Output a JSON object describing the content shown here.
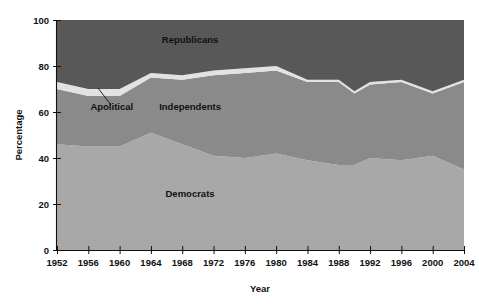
{
  "chart_data": {
    "type": "area",
    "stacked": true,
    "title": "",
    "xlabel": "Year",
    "ylabel": "Percentage",
    "xlim": [
      1952,
      2004
    ],
    "ylim": [
      0,
      100
    ],
    "grid": false,
    "legend_position": "inline-annotations",
    "x": [
      1952,
      1956,
      1960,
      1964,
      1968,
      1972,
      1976,
      1980,
      1984,
      1988,
      1990,
      1992,
      1996,
      2000,
      2004
    ],
    "xtick_labels": [
      "1952",
      "1956",
      "1960",
      "1964",
      "1968",
      "1972",
      "1976",
      "1980",
      "1984",
      "1988",
      "1992",
      "1996",
      "2000",
      "2004"
    ],
    "xticks": [
      1952,
      1956,
      1960,
      1964,
      1968,
      1972,
      1976,
      1980,
      1984,
      1988,
      1992,
      1996,
      2000,
      2004
    ],
    "ytick_labels": [
      "0",
      "20",
      "40",
      "60",
      "80",
      "100"
    ],
    "yticks": [
      0,
      20,
      40,
      60,
      80,
      100
    ],
    "series": [
      {
        "name": "Democrats",
        "color": "#a8a8a8",
        "values": [
          46,
          45,
          45,
          51,
          46,
          41,
          40,
          42,
          39,
          37,
          37,
          40,
          39,
          41,
          35
        ]
      },
      {
        "name": "Independents",
        "color": "#8a8a8a",
        "values": [
          24,
          22,
          22,
          24,
          28,
          35,
          37,
          36,
          34,
          36,
          31,
          32,
          34,
          27,
          38
        ]
      },
      {
        "name": "Apolitical",
        "color": "#e2e2e2",
        "values": [
          3,
          3,
          3,
          2,
          2,
          2,
          2,
          2,
          1,
          1,
          1,
          1,
          1,
          1,
          1
        ]
      },
      {
        "name": "Republicans",
        "color": "#585858",
        "values": [
          27,
          30,
          30,
          23,
          24,
          22,
          21,
          20,
          26,
          26,
          31,
          27,
          26,
          31,
          26
        ]
      }
    ],
    "annotations": [
      {
        "name": "Republicans",
        "text": "Republicans",
        "x": 1969,
        "y": 90
      },
      {
        "name": "Independents",
        "text": "Independents",
        "x": 1969,
        "y": 61
      },
      {
        "name": "Democrats",
        "text": "Democrats",
        "x": 1969,
        "y": 23
      },
      {
        "name": "Apolitical",
        "text": "Apolitical",
        "x": 1959,
        "y": 61
      }
    ]
  },
  "axes": {
    "y_title": "Percentage",
    "x_title": "Year"
  }
}
